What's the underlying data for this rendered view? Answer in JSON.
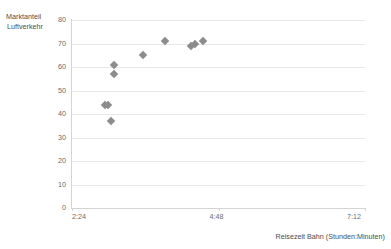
{
  "chart_data": {
    "type": "scatter",
    "title": "",
    "xlabel": "Reisezeit Bahn (Stunden:Minuten)",
    "ylabel": "Marktanteil Luftverkehr",
    "ylabel_line1": "Marktanteil",
    "ylabel_line2": "Luftverkehr",
    "xlim": [
      144,
      432
    ],
    "ylim": [
      0,
      80
    ],
    "yticks": [
      80,
      70,
      60,
      50,
      40,
      30,
      20,
      10,
      0
    ],
    "ytick_labels": [
      "80",
      "70",
      "60",
      "50",
      "40",
      "30",
      "20",
      "10",
      "0"
    ],
    "xticks": [
      144,
      288,
      432
    ],
    "xtick_labels": [
      "2:24",
      "4:48",
      "7:12"
    ],
    "grid": "horizontal",
    "legend": "none",
    "marker_shape": "diamond",
    "marker_color": "#8c8c8c",
    "grid_color": "#e8e8e8",
    "axis_color": "#d4d4d4",
    "points": [
      {
        "x_time": "2:56",
        "x": 176,
        "y": 44
      },
      {
        "x_time": "2:59",
        "x": 179,
        "y": 44
      },
      {
        "x_time": "3:02",
        "x": 182,
        "y": 37
      },
      {
        "x_time": "3:05",
        "x": 185,
        "y": 61
      },
      {
        "x_time": "3:05",
        "x": 185,
        "y": 57
      },
      {
        "x_time": "3:34",
        "x": 214,
        "y": 65
      },
      {
        "x_time": "3:55",
        "x": 235,
        "y": 71
      },
      {
        "x_time": "4:21",
        "x": 261,
        "y": 69
      },
      {
        "x_time": "4:25",
        "x": 265,
        "y": 70
      },
      {
        "x_time": "4:33",
        "x": 273,
        "y": 71
      }
    ]
  }
}
